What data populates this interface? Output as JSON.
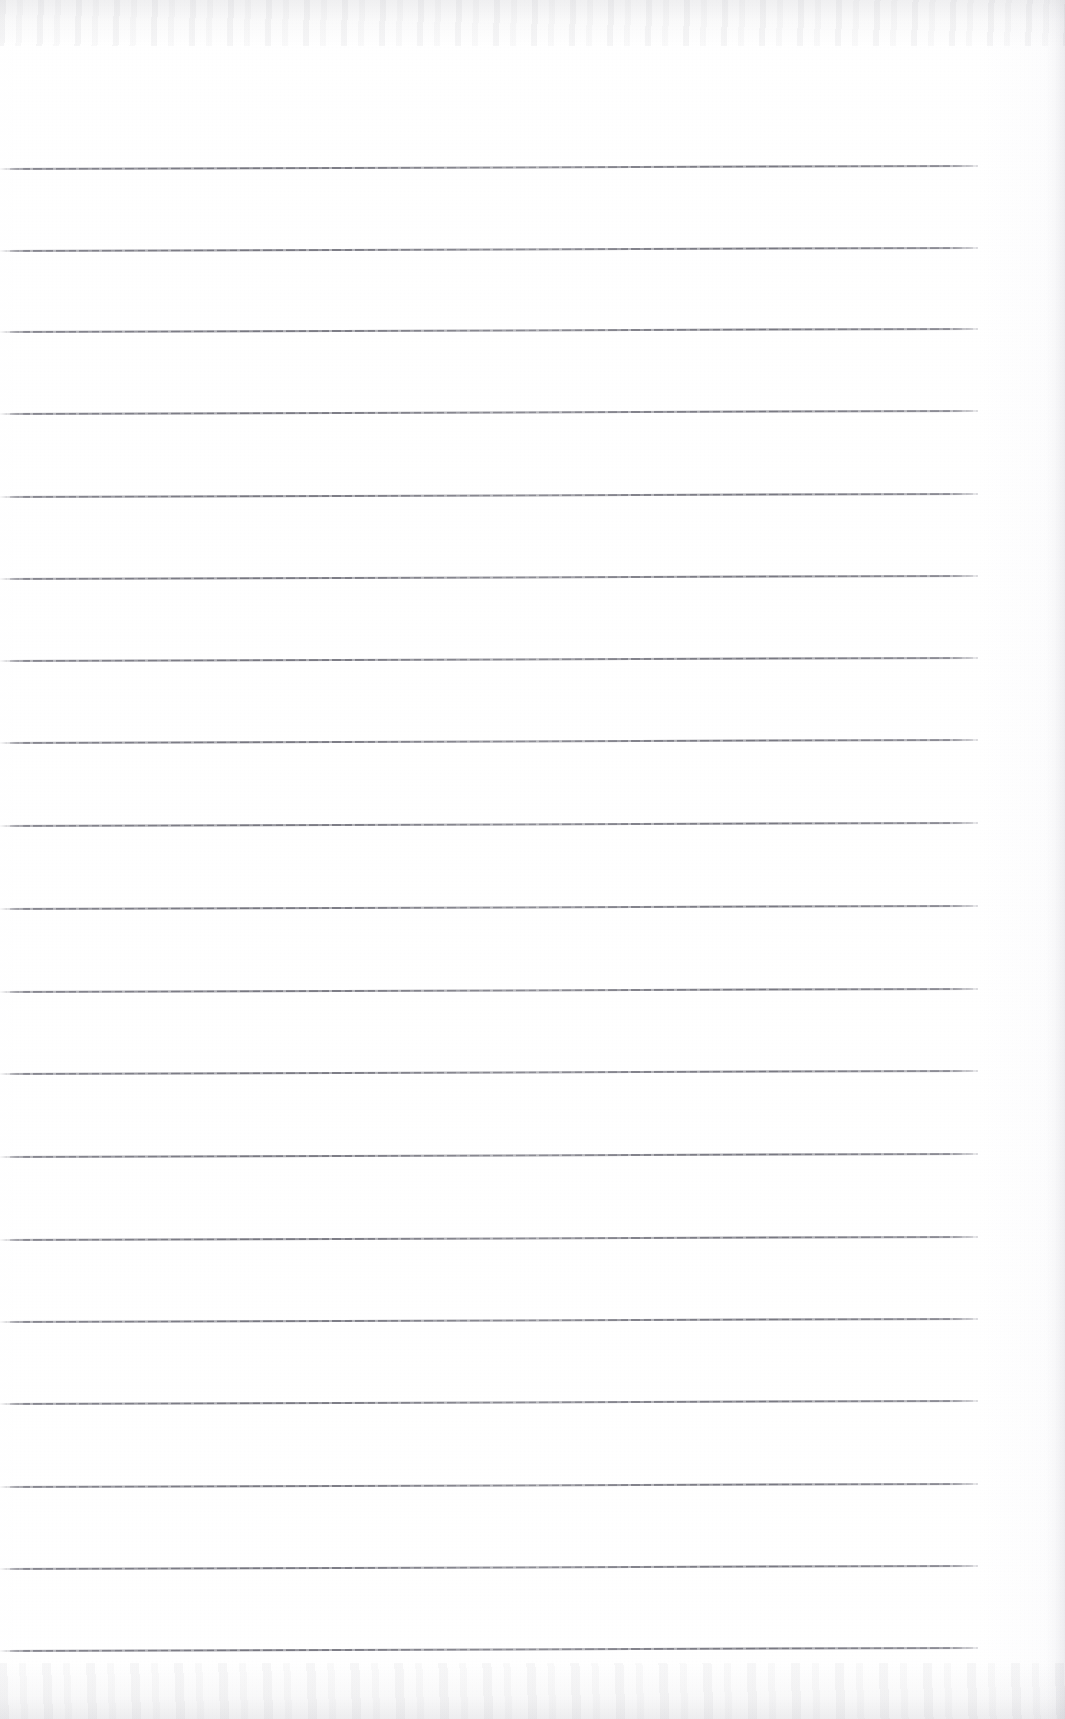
{
  "document": {
    "kind": "scanned-ruled-notebook-page",
    "title": "Blank lined notebook page",
    "visible_text": "",
    "has_handwriting": false,
    "has_printed_text": false,
    "page_width_px": 1065,
    "page_height_px": 1719
  },
  "paper": {
    "background_color": "#fefefe",
    "paper_tone": "#ffffff",
    "edge_noise_color": "#9292a0",
    "right_edge_shadow_color": "#96969e"
  },
  "ruling": {
    "line_color": "#78787f",
    "line_count": 19,
    "line_thickness_px": 2,
    "line_spacing_px": 82,
    "line_start_x_px": 0,
    "line_end_x_px": 978,
    "first_line_y_px": 168,
    "last_line_y_px": 1650,
    "line_y_positions": [
      168,
      250,
      331,
      413,
      496,
      578,
      660,
      742,
      825,
      908,
      991,
      1073,
      1156,
      1239,
      1321,
      1403,
      1486,
      1568,
      1650
    ],
    "line_slant_deg": -0.18
  },
  "regions": {
    "top_margin_label": "top margin",
    "bottom_margin_label": "bottom margin",
    "right_margin_label": "right margin",
    "writing_area_label": "writing area"
  }
}
